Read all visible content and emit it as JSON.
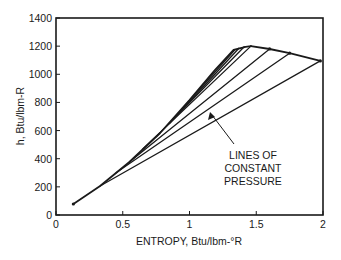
{
  "chart_data": {
    "type": "line",
    "title": "",
    "xlabel": "ENTROPY, Btu/lbm-°R",
    "ylabel": "h, Btu/lbm-R",
    "xlim": [
      0,
      2
    ],
    "ylim": [
      0,
      1400
    ],
    "xticks": [
      0,
      0.5,
      1,
      1.5,
      2
    ],
    "xtick_labels": [
      "0",
      "0.5",
      "1",
      "1.5",
      "2"
    ],
    "yticks": [
      0,
      200,
      400,
      600,
      800,
      1000,
      1200,
      1400
    ],
    "ytick_labels": [
      "0",
      "200",
      "400",
      "600",
      "800",
      "1000",
      "1200",
      "1400"
    ],
    "grid": false,
    "legend": null,
    "series": [
      {
        "name": "Saturated liquid line",
        "x": [
          0.13,
          0.33,
          0.55,
          0.78,
          1.0,
          1.19,
          1.33,
          1.42,
          1.46
        ],
        "y": [
          78,
          206,
          377,
          583,
          817,
          1030,
          1173,
          1195,
          1200
        ]
      },
      {
        "name": "Saturated vapor line",
        "x": [
          1.46,
          1.6,
          1.75,
          1.98
        ],
        "y": [
          1200,
          1180,
          1150,
          1095
        ]
      },
      {
        "name": "Constant pressure 1",
        "x": [
          0.33,
          1.98
        ],
        "y": [
          206,
          1095
        ]
      },
      {
        "name": "Constant pressure 2",
        "x": [
          0.45,
          1.75
        ],
        "y": [
          300,
          1150
        ]
      },
      {
        "name": "Constant pressure 3",
        "x": [
          0.55,
          1.6
        ],
        "y": [
          377,
          1180
        ]
      },
      {
        "name": "Constant pressure 4",
        "x": [
          0.65,
          1.46
        ],
        "y": [
          470,
          1200
        ]
      },
      {
        "name": "Constant pressure 5",
        "x": [
          0.75,
          1.41
        ],
        "y": [
          555,
          1195
        ]
      },
      {
        "name": "Constant pressure 6",
        "x": [
          0.85,
          1.37
        ],
        "y": [
          650,
          1185
        ]
      },
      {
        "name": "Constant pressure 7",
        "x": [
          0.95,
          1.34
        ],
        "y": [
          760,
          1175
        ]
      }
    ],
    "annotations": [
      {
        "text": [
          "LINES OF",
          "CONSTANT",
          "PRESSURE"
        ],
        "x": 1.47,
        "y": 400,
        "arrow_to": {
          "x": 1.15,
          "y": 727
        }
      }
    ]
  },
  "axes": {
    "xlabel": "ENTROPY, Btu/lbm-°R",
    "ylabel": "h, Btu/lbm-R"
  },
  "annotation": {
    "line1": "LINES OF",
    "line2": "CONSTANT",
    "line3": "PRESSURE"
  }
}
